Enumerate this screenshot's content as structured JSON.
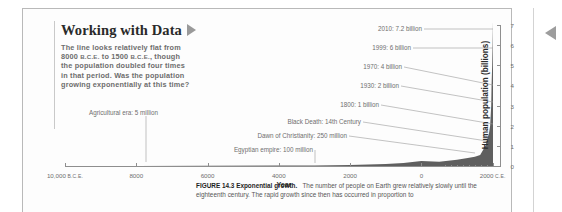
{
  "callout": {
    "title": "Working with Data",
    "triangle_icon": "play-triangle-icon",
    "body_line1": "The line looks relatively flat from",
    "body_line2_a": "8000 ",
    "body_line2_sc1": "B.C.E.",
    "body_line2_b": " to 1500 ",
    "body_line2_sc2": "B.C.E.",
    "body_line2_c": ", though",
    "body_line3": "the population doubled four times",
    "body_line4": "in that period. Was the population",
    "body_line5": "growing exponentially at this time?"
  },
  "caption": {
    "figure_label": "FIGURE 14.3 Exponential growth.",
    "text": "The number of people on Earth grew relatively slowly until the eighteenth century. The rapid growth since then has occurred in proportion to"
  },
  "chart_data": {
    "type": "area",
    "title": "Exponential growth",
    "xlabel": "Year",
    "ylabel": "Human population (billions)",
    "ylim": [
      0,
      7
    ],
    "yticks": [
      0,
      1,
      2,
      3,
      4,
      5,
      6,
      7
    ],
    "ytick_labels": [
      "0",
      "1",
      "2",
      "3",
      "4",
      "5",
      "6",
      "7"
    ],
    "xlim": [
      -10000,
      2010
    ],
    "xticks": [
      -10000,
      -8000,
      -6000,
      -4000,
      -2000,
      0,
      2000
    ],
    "xtick_labels": [
      {
        "main": "10,000",
        "suffix": "B.C.E."
      },
      {
        "main": "8000",
        "suffix": ""
      },
      {
        "main": "6000",
        "suffix": ""
      },
      {
        "main": "4000",
        "suffix": ""
      },
      {
        "main": "2000",
        "suffix": ""
      },
      {
        "main": "0",
        "suffix": ""
      },
      {
        "main": "2000",
        "suffix": "C.E."
      }
    ],
    "grid": false,
    "legend": "none",
    "x": [
      -10000,
      -8000,
      -6000,
      -4000,
      -3000,
      -2000,
      -1000,
      -500,
      0,
      500,
      1000,
      1300,
      1500,
      1650,
      1800,
      1900,
      1930,
      1960,
      1970,
      1987,
      1999,
      2010
    ],
    "values": [
      0.004,
      0.005,
      0.01,
      0.02,
      0.03,
      0.05,
      0.1,
      0.15,
      0.25,
      0.21,
      0.31,
      0.4,
      0.46,
      0.55,
      1.0,
      1.65,
      2.0,
      3.0,
      4.0,
      5.0,
      6.0,
      7.2
    ],
    "annotations": [
      {
        "label": "2010: 7.2 billion",
        "year": 2010,
        "population": 7.2
      },
      {
        "label": "1999: 6 billion",
        "year": 1999,
        "population": 6
      },
      {
        "label": "1970: 4 billion",
        "year": 1970,
        "population": 4
      },
      {
        "label": "1930: 2 billion",
        "year": 1930,
        "population": 2
      },
      {
        "label": "1800: 1 billion",
        "year": 1800,
        "population": 1
      },
      {
        "label": "Black Death: 14th Century",
        "year": 1350,
        "population": 0.37
      },
      {
        "label": "Dawn of Christianity: 250 million",
        "year": 0,
        "population": 0.25
      },
      {
        "label": "Egyptian empire: 100 million",
        "year": -1000,
        "population": 0.1
      },
      {
        "label": "Agricultural era: 5 million",
        "year": -8000,
        "population": 0.005
      }
    ]
  }
}
